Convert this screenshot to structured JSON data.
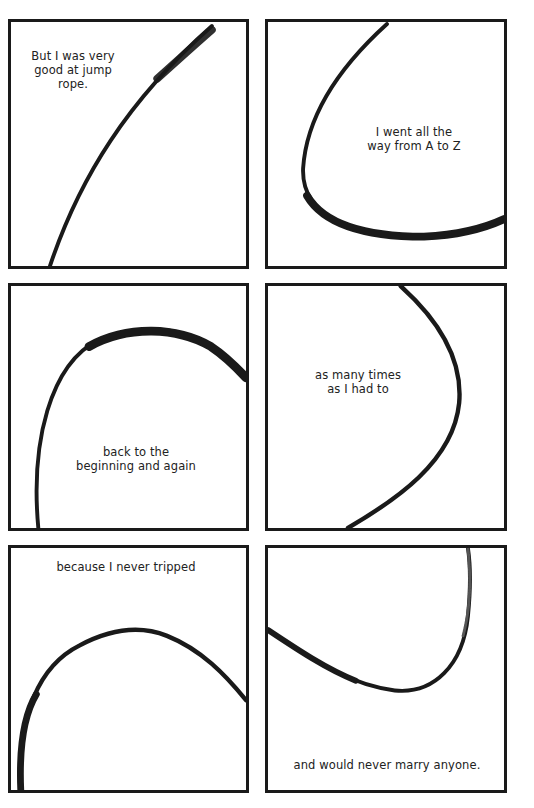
{
  "page": {
    "type": "comic-page",
    "background": "#ffffff",
    "ink_color": "#1a1a1a"
  },
  "panels": [
    {
      "id": 1,
      "caption": "But I was very\ngood at jump rope.",
      "drawing": "rope-arc-diagonal"
    },
    {
      "id": 2,
      "caption": "I went all the\nway from A to Z",
      "drawing": "rope-arc-left-curve"
    },
    {
      "id": 3,
      "caption": "back to the\nbeginning and again",
      "drawing": "rope-arc-top"
    },
    {
      "id": 4,
      "caption": "as many times\nas I had to",
      "drawing": "rope-arc-right-curve"
    },
    {
      "id": 5,
      "caption": "because I never tripped",
      "drawing": "rope-arc-top"
    },
    {
      "id": 6,
      "caption": "and would never marry anyone.",
      "drawing": "rope-arc-bottom"
    }
  ]
}
